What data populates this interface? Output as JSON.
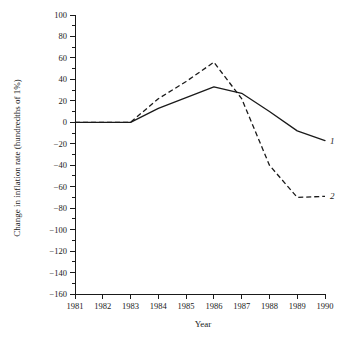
{
  "chart_data": {
    "type": "line",
    "title": "",
    "xlabel": "Year",
    "ylabel": "Change in inflation rate (hundredths of 1%)",
    "x": [
      1981,
      1982,
      1983,
      1984,
      1985,
      1986,
      1987,
      1988,
      1989,
      1990
    ],
    "xlim": [
      1981,
      1990
    ],
    "ylim": [
      -160,
      100
    ],
    "y_tick_step": 20,
    "y_minor_step": 10,
    "grid": false,
    "legend_position": "inline-right-end",
    "series": [
      {
        "name": "1",
        "style": "solid",
        "label": "1",
        "values": [
          0,
          0,
          0,
          13,
          23,
          33,
          27,
          10,
          -8,
          -17
        ]
      },
      {
        "name": "2",
        "style": "dashed",
        "label": "2",
        "values": [
          0,
          0,
          0,
          22,
          38,
          56,
          22,
          -40,
          -70,
          -69
        ]
      }
    ],
    "xticklabels": [
      "1981",
      "1982",
      "1983",
      "1984",
      "1985",
      "1986",
      "1987",
      "1988",
      "1989",
      "1990"
    ],
    "yticklabels": [
      "100",
      "80",
      "60",
      "40",
      "20",
      "0",
      "−20",
      "−40",
      "−60",
      "−80",
      "−100",
      "−120",
      "−140",
      "−160"
    ],
    "ytickvalues": [
      100,
      80,
      60,
      40,
      20,
      0,
      -20,
      -40,
      -60,
      -80,
      -100,
      -120,
      -140,
      -160
    ]
  }
}
